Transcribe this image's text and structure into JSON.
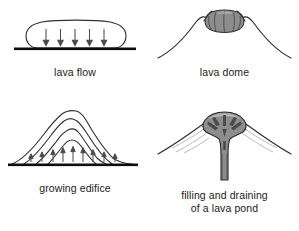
{
  "figure": {
    "background_color": "#ffffff",
    "ink_color": "#2b2b2b",
    "ground_color": "#111111",
    "magma_fill_color": "#8b8b8b",
    "magma_fill_light": "#a9a9a9",
    "arrow_color": "#4a4a4a",
    "panel_count": 4
  },
  "panels": [
    {
      "id": "lava-flow",
      "caption": "lava flow",
      "icon_name": "lava-flow-diagram",
      "description": "Flat pill-shaped lava flow body resting on a thick horizontal ground line",
      "arrow_count": 5,
      "arrow_direction": "down",
      "shape": "rounded-slab",
      "ground_line": true
    },
    {
      "id": "lava-dome",
      "caption": "lava dome",
      "icon_name": "lava-dome-diagram",
      "description": "Gray lobate dome filling a summit crater notch between two volcano flanks",
      "arrow_count": 0,
      "arrow_direction": "none",
      "shape": "bulbous-dome-in-crater",
      "ground_line": false
    },
    {
      "id": "growing-edifice",
      "caption": "growing edifice",
      "icon_name": "growing-edifice-diagram",
      "description": "Four nested cone outlines showing successive edifice growth, with upward load arrows at the base",
      "arrow_count": 9,
      "arrow_direction": "up",
      "shape": "nested-cones",
      "ground_line": true
    },
    {
      "id": "lava-pond",
      "caption": "filling and draining\nof a lava pond",
      "icon_name": "lava-pond-diagram",
      "description": "Gray funnel-shaped lava pond and feeder conduit beneath a summit, with convergent dark arrows",
      "arrow_count": 7,
      "arrow_direction": "convergent",
      "shape": "funnel-conduit",
      "ground_line": false
    }
  ]
}
